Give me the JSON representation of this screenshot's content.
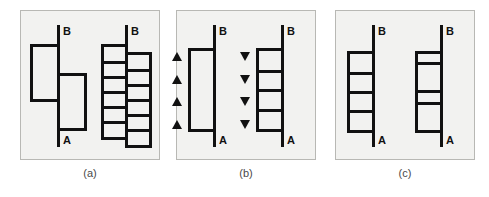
{
  "figure": {
    "background_color": "#ffffff",
    "panel_background_color": "#f2f2f0",
    "panel_border_color": "#b8b8b4",
    "ink_color": "#111111",
    "panels": [
      {
        "id": "a",
        "caption": "(a)",
        "units": [
          {
            "id": "a-left",
            "top_label": "B",
            "bottom_label": "A",
            "description": "two offset rectangles straddling the vertical line",
            "boxes": [
              {
                "side": "left",
                "top": 33,
                "height": 58,
                "width": 30,
                "segments": 1
              },
              {
                "side": "right",
                "top": 62,
                "height": 58,
                "width": 30,
                "segments": 1
              }
            ],
            "triangles": {
              "count": 0,
              "direction": "none"
            }
          },
          {
            "id": "a-right",
            "top_label": "B",
            "bottom_label": "A",
            "description": "interleaved ladder of boxes on both sides of the line",
            "boxes": [
              {
                "side": "left",
                "top": 33,
                "height": 96,
                "width": 27,
                "segments": 6
              },
              {
                "side": "right",
                "top": 41,
                "height": 96,
                "width": 27,
                "segments": 6
              }
            ],
            "triangles": {
              "count": 0,
              "direction": "none"
            }
          }
        ]
      },
      {
        "id": "b",
        "caption": "(b)",
        "units": [
          {
            "id": "b-left",
            "top_label": "B",
            "bottom_label": "A",
            "description": "single tall rectangle with four upward triangles alongside",
            "boxes": [
              {
                "side": "left",
                "top": 37,
                "height": 84,
                "width": 28,
                "segments": 1
              }
            ],
            "triangles": {
              "count": 4,
              "direction": "up"
            }
          },
          {
            "id": "b-right",
            "top_label": "B",
            "bottom_label": "A",
            "description": "rectangle subdivided into four segments with four downward triangles alongside",
            "boxes": [
              {
                "side": "left",
                "top": 37,
                "height": 84,
                "width": 28,
                "segments": 4
              }
            ],
            "triangles": {
              "count": 4,
              "direction": "down"
            }
          }
        ]
      },
      {
        "id": "c",
        "caption": "(c)",
        "units": [
          {
            "id": "c-left",
            "top_label": "B",
            "bottom_label": "A",
            "description": "rectangle subdivided into four equal segments",
            "boxes": [
              {
                "side": "left",
                "top": 40,
                "height": 82,
                "width": 28,
                "segments": 4,
                "segment_ratios": [
                  1,
                  1,
                  1,
                  1
                ]
              }
            ],
            "triangles": {
              "count": 0,
              "direction": "none"
            }
          },
          {
            "id": "c-right",
            "top_label": "B",
            "bottom_label": "A",
            "description": "rectangle subdivided into four unequal segments, thin and tall alternating",
            "boxes": [
              {
                "side": "left",
                "top": 40,
                "height": 82,
                "width": 28,
                "segments": 4,
                "segment_ratios": [
                  0.45,
                  1.35,
                  0.6,
                  1.3
                ]
              }
            ],
            "triangles": {
              "count": 0,
              "direction": "none"
            }
          }
        ]
      }
    ]
  }
}
